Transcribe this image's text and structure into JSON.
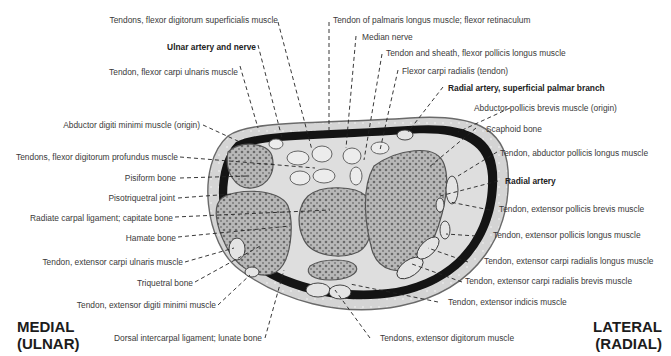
{
  "figure": {
    "orientation": {
      "left": {
        "line1": "MEDIAL",
        "line2": "(ULNAR)"
      },
      "right": {
        "line1": "LATERAL",
        "line2": "(RADIAL)"
      }
    },
    "labels_top": [
      {
        "text": "Tendons, flexor digitorum superficialis muscle",
        "bold": false
      },
      {
        "text": "Ulnar artery and nerve",
        "bold": true
      },
      {
        "text": "Tendon, flexor carpi ulnaris muscle",
        "bold": false
      },
      {
        "text": "Tendon of palmaris longus muscle; flexor retinaculum",
        "bold": false
      },
      {
        "text": "Median nerve",
        "bold": false
      },
      {
        "text": "Tendon and sheath, flexor pollicis longus muscle",
        "bold": false
      },
      {
        "text": "Flexor carpi radialis (tendon)",
        "bold": false
      },
      {
        "text": "Radial artery, superficial palmar branch",
        "bold": true
      }
    ],
    "labels_left": [
      {
        "text": "Abductor digiti minimi muscle (origin)"
      },
      {
        "text": "Tendons, flexor digitorum profundus muscle"
      },
      {
        "text": "Pisiform bone"
      },
      {
        "text": "Pisotriquetral joint"
      },
      {
        "text": "Radiate carpal ligament; capitate bone"
      },
      {
        "text": "Hamate bone"
      },
      {
        "text": "Tendon, extensor carpi ulnaris muscle"
      },
      {
        "text": "Triquetral bone"
      },
      {
        "text": "Tendon, extensor digiti minimi muscle"
      },
      {
        "text": "Dorsal intercarpal ligament; lunate bone"
      }
    ],
    "labels_right": [
      {
        "text": "Abductor pollicis brevis muscle (origin)",
        "bold": false
      },
      {
        "text": "Scaphoid bone",
        "bold": false
      },
      {
        "text": "Tendon, abductor pollicis longus muscle",
        "bold": false
      },
      {
        "text": "Radial artery",
        "bold": true
      },
      {
        "text": "Tendon, extensor pollicis brevis muscle",
        "bold": false
      },
      {
        "text": "Tendon, extensor pollicis longus muscle",
        "bold": false
      },
      {
        "text": "Tendon, extensor carpi radialis longus muscle",
        "bold": false
      },
      {
        "text": "Tendon, extensor carpi radialis brevis muscle",
        "bold": false
      },
      {
        "text": "Tendon, extensor indicis muscle",
        "bold": false
      },
      {
        "text": "Tendons, extensor digitorum muscle",
        "bold": false
      }
    ],
    "colors": {
      "skin": "#d9d9d9",
      "bone": "#9a9a9a",
      "dark_tissue": "#111111",
      "tendon": "#e6e6e6",
      "label_text": "#3a3a3a"
    }
  }
}
